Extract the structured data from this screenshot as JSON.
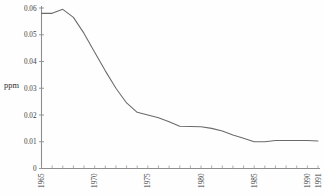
{
  "chart_data": {
    "type": "line",
    "title": "",
    "xlabel": "",
    "ylabel": "ppm",
    "x": [
      1965,
      1966,
      1967,
      1968,
      1969,
      1970,
      1971,
      1972,
      1973,
      1974,
      1975,
      1976,
      1977,
      1978,
      1979,
      1980,
      1981,
      1982,
      1983,
      1984,
      1985,
      1986,
      1987,
      1988,
      1989,
      1990,
      1991
    ],
    "values": [
      0.058,
      0.058,
      0.0595,
      0.0565,
      0.0505,
      0.0435,
      0.0365,
      0.03,
      0.0245,
      0.021,
      0.02,
      0.019,
      0.0175,
      0.0158,
      0.0157,
      0.0156,
      0.015,
      0.014,
      0.0125,
      0.0113,
      0.01,
      0.01,
      0.0105,
      0.0105,
      0.0105,
      0.0105,
      0.0103
    ],
    "series": [
      {
        "name": "ppm",
        "values": [
          0.058,
          0.058,
          0.0595,
          0.0565,
          0.0505,
          0.0435,
          0.0365,
          0.03,
          0.0245,
          0.021,
          0.02,
          0.019,
          0.0175,
          0.0158,
          0.0157,
          0.0156,
          0.015,
          0.014,
          0.0125,
          0.0113,
          0.01,
          0.01,
          0.0105,
          0.0105,
          0.0105,
          0.0105,
          0.0103
        ],
        "color": "#6a6a6a"
      }
    ],
    "ylim": [
      0,
      0.06
    ],
    "xlim": [
      1965,
      1991
    ],
    "ytick_labels": [
      "0.06",
      "0.05",
      "0.04",
      "0.03",
      "0.02",
      "0.01",
      "0"
    ],
    "ytick_values": [
      0.06,
      0.05,
      0.04,
      0.03,
      0.02,
      0.01,
      0
    ],
    "xtick_labels": [
      "1965",
      "1970",
      "1975",
      "1980",
      "1985",
      "1990",
      "1991"
    ],
    "xtick_values": [
      1965,
      1970,
      1975,
      1980,
      1985,
      1990,
      1991
    ],
    "xtick_rotation": "90",
    "grid": "off",
    "legend": "none",
    "line_color": "#6a6a6a",
    "axis_color": "#8d8d8d",
    "background": "#fefefe"
  }
}
